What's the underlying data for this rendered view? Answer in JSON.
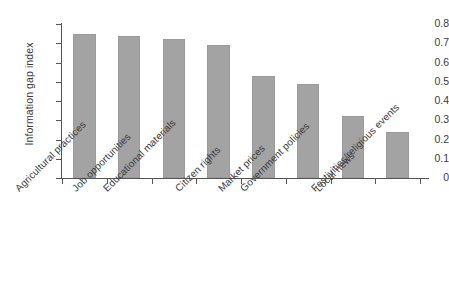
{
  "chart_data": {
    "type": "bar",
    "title": "",
    "subtitle": "",
    "xlabel": "",
    "ylabel": "Information gap index",
    "ylim": [
      0,
      0.8
    ],
    "ytick_labels": [
      "0.8",
      "0.7",
      "0.6",
      "0.5",
      "0.4",
      "0.3",
      "0.2",
      "0.1",
      "0"
    ],
    "ytick_values": [
      0.8,
      0.7,
      0.6,
      0.5,
      0.4,
      0.3,
      0.2,
      0.1,
      0
    ],
    "grid": false,
    "legend": false,
    "legend_position": "none",
    "bar_color": "#a3a3a3",
    "bar_edge_color": "#9a9a9a",
    "axis_color": "#555555",
    "background_color": "#ffffff",
    "xtick_label_rotation": -45,
    "categories": [
      "Agricultural practices",
      "Job opportunities",
      "Educational materials",
      "Citizen rights",
      "Market prices",
      "Government policies",
      "Local news",
      "Festivities/religious events"
    ],
    "values": [
      0.75,
      0.74,
      0.72,
      0.69,
      0.53,
      0.49,
      0.32,
      0.24
    ]
  }
}
